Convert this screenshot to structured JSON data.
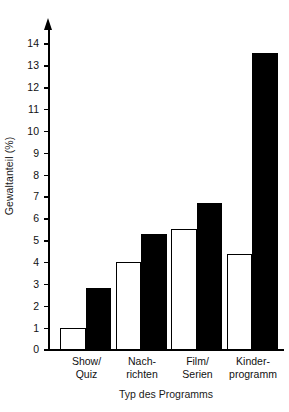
{
  "chart_data": {
    "type": "bar",
    "title": "",
    "subtitle": "",
    "xlabel": "Typ des Programms",
    "ylabel": "Gewaltanteil (%)",
    "categories": [
      "Show/\nQuiz",
      "Nach-\nrichten",
      "Film/\nSerien",
      "Kinder-\nprogramm"
    ],
    "categories_flat": [
      "Show/Quiz",
      "Nachrichten",
      "Film/Serien",
      "Kinderprogramm"
    ],
    "series": [
      {
        "name": "weiss",
        "fill": "#ffffff",
        "values": [
          1.0,
          4.0,
          5.5,
          4.35
        ]
      },
      {
        "name": "schwarz",
        "fill": "#000000",
        "values": [
          2.8,
          5.3,
          6.7,
          13.55
        ]
      }
    ],
    "ylim": [
      0,
      14.8
    ],
    "yticks": [
      0,
      1,
      2,
      3,
      4,
      5,
      6,
      7,
      8,
      9,
      10,
      11,
      12,
      13,
      14
    ],
    "ytick_labels": [
      "0",
      "1",
      "2",
      "3",
      "4",
      "5",
      "6",
      "7",
      "8",
      "9",
      "10",
      "11",
      "12",
      "13",
      "14"
    ],
    "grid": false,
    "legend": "none",
    "axis_color": "#000000"
  }
}
